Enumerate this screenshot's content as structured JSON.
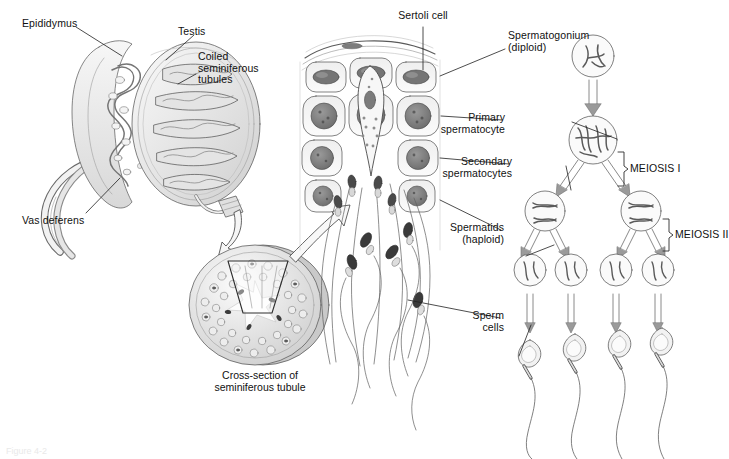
{
  "figure": {
    "domain": "biology-diagram",
    "title_visible": false,
    "background_color": "#ffffff",
    "ink_color": "#1a1a1a",
    "fill_light": "#efefef",
    "fill_mid": "#d2d2d2",
    "fill_dark": "#8d8d8d",
    "fill_nucleus": "#6f6f6f",
    "cut_caption": "Figure 4-2"
  },
  "panels": {
    "testis_panel": {
      "labels": [
        {
          "id": "epididymus",
          "text": "Epididymus"
        },
        {
          "id": "testis",
          "text": "Testis"
        },
        {
          "id": "coiled_seminiferous_tubules",
          "text": "Coiled\nseminiferous\ntubules"
        },
        {
          "id": "vas_deferens",
          "text": "Vas deferens"
        }
      ]
    },
    "cross_section_panel": {
      "caption": "Cross-section of\nseminiferous tubule"
    },
    "tubule_wall_panel": {
      "labels": [
        {
          "id": "sertoli_cell",
          "text": "Sertoli cell"
        },
        {
          "id": "spermatogonium",
          "text": "Spermatogonium\n(diploid)"
        },
        {
          "id": "primary_spermatocyte",
          "text": "Primary\nspermatocyte"
        },
        {
          "id": "secondary_spermatocytes",
          "text": "Secondary\nspermatocytes"
        },
        {
          "id": "spermatids",
          "text": "Spermatids\n(haploid)"
        },
        {
          "id": "sperm_cells",
          "text": "Sperm\ncells"
        }
      ]
    },
    "meiosis_panel": {
      "brackets": [
        {
          "id": "meiosis_1",
          "text": "MEIOSIS I"
        },
        {
          "id": "meiosis_2",
          "text": "MEIOSIS II"
        }
      ],
      "stages": [
        {
          "id": "spermatogonium-cell",
          "count": 1,
          "ploidy": "diploid"
        },
        {
          "id": "primary-spermatocyte-cell",
          "count": 1,
          "ploidy": "diploid"
        },
        {
          "id": "secondary-spermatocyte-cell",
          "count": 2,
          "ploidy": "haploid"
        },
        {
          "id": "spermatid-cell",
          "count": 4,
          "ploidy": "haploid"
        },
        {
          "id": "sperm-cell",
          "count": 4,
          "ploidy": "haploid"
        }
      ]
    }
  }
}
